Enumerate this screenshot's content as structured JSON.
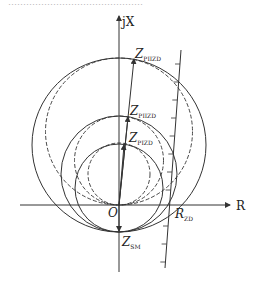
{
  "diagram": {
    "top_caption_fragment": "………………………………………",
    "axes": {
      "y_label": "jX",
      "x_label": "R",
      "origin_label": "O"
    },
    "labels": [
      {
        "id": "z-large",
        "main": "Z",
        "sub": "PIIZD"
      },
      {
        "id": "z-mid",
        "main": "Z",
        "sub": "PIIZD"
      },
      {
        "id": "z-small",
        "main": "Z",
        "sub": "PIZD"
      },
      {
        "id": "z-sm",
        "main": "Z",
        "sub": "SM"
      },
      {
        "id": "r-zd",
        "main": "R",
        "sub": "ZD"
      }
    ],
    "colors": {
      "stroke": "#333333",
      "background": "#ffffff"
    }
  }
}
